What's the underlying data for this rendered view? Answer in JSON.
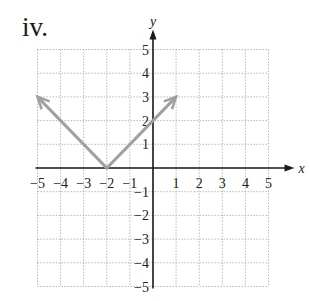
{
  "figure": {
    "label": "iv."
  },
  "colors": {
    "grid": "#b8b8b8",
    "axis": "#1a1a1a",
    "curve": "#a0a0a0",
    "text": "#222222"
  },
  "chart_data": {
    "type": "line",
    "title": "iv.",
    "function": "y = |x + 2|",
    "xlabel": "x",
    "ylabel": "y",
    "xlim": [
      -5,
      5
    ],
    "ylim": [
      -5,
      5
    ],
    "grid": true,
    "x_ticks": [
      "-5",
      "-4",
      "-3",
      "-2",
      "-1",
      "1",
      "2",
      "3",
      "4",
      "5"
    ],
    "y_ticks": [
      "5",
      "4",
      "3",
      "2",
      "1",
      "-1",
      "-2",
      "-3",
      "-4",
      "-5"
    ],
    "series": [
      {
        "name": "V-shaped graph",
        "x": [
          -5,
          -2,
          1
        ],
        "y": [
          3,
          0,
          3
        ],
        "arrows": "both ends"
      }
    ],
    "vertex": [
      -2,
      0
    ],
    "y_intercept": [
      0,
      2
    ]
  }
}
